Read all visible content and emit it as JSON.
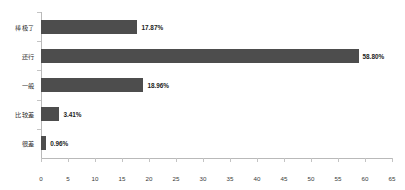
{
  "chart_data": {
    "type": "bar",
    "orientation": "horizontal",
    "title": "",
    "xlabel": "",
    "ylabel": "",
    "categories": [
      "棒极了",
      "还行",
      "一般",
      "比较差",
      "很差"
    ],
    "values": [
      17.87,
      58.8,
      18.96,
      3.41,
      0.96
    ],
    "value_labels": [
      "17.87%",
      "58.80%",
      "18.96%",
      "3.41%",
      "0.96%"
    ],
    "xlim": [
      0,
      65
    ],
    "xticks": [
      0,
      5,
      10,
      15,
      20,
      25,
      30,
      35,
      40,
      45,
      50,
      55,
      60,
      65
    ],
    "xtick_labels": [
      "0",
      "5",
      "10",
      "15",
      "20",
      "25",
      "30",
      "35",
      "40",
      "45",
      "50",
      "55",
      "60",
      "65"
    ],
    "grid": false,
    "legend": false,
    "series": [
      {
        "name": "",
        "values": [
          17.87,
          58.8,
          18.96,
          3.41,
          0.96
        ]
      }
    ],
    "colors": {
      "bar": "#4d4d4d",
      "axis": "#b9b9b9",
      "text": "#2f2f2f",
      "background": "#ffffff"
    }
  }
}
